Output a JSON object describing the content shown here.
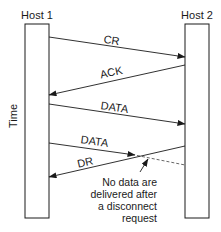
{
  "diagram": {
    "type": "sequence",
    "hosts": [
      {
        "label": "Host 1"
      },
      {
        "label": "Host 2"
      }
    ],
    "axis_label": "Time",
    "messages": [
      {
        "label": "CR",
        "from": "Host 1",
        "to": "Host 2",
        "style": "solid"
      },
      {
        "label": "ACK",
        "from": "Host 2",
        "to": "Host 1",
        "style": "solid"
      },
      {
        "label": "DATA",
        "from": "Host 1",
        "to": "Host 2",
        "style": "solid"
      },
      {
        "label": "DATA",
        "from": "Host 1",
        "to": "Host 2",
        "style": "solid-then-dashed"
      },
      {
        "label": "DR",
        "from": "Host 2",
        "to": "Host 1",
        "style": "solid"
      }
    ],
    "annotation": {
      "lines": [
        "No data are",
        "delivered after",
        "a disconnect",
        "request"
      ]
    },
    "colors": {
      "line": "#1a1a1a",
      "dashed": "#555555",
      "background": "#ffffff"
    }
  }
}
